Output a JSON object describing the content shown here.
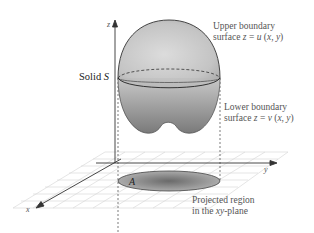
{
  "figure": {
    "labels": {
      "z_axis": "z",
      "y_axis": "y",
      "x_axis": "x",
      "solid": "Solid S",
      "upper_line1": "Upper boundary",
      "upper_line2_prefix": "surface ",
      "upper_line2_eq": "z = u (x, y)",
      "lower_line1": "Lower boundary",
      "lower_line2_prefix": "surface ",
      "lower_line2_eq": "z = v (x, y)",
      "region": "A",
      "projected_line1": "Projected region",
      "projected_line2": "in the xy-plane"
    },
    "colors": {
      "solid_light": "#d2d2d2",
      "solid_dark": "#8a8a8a",
      "grid": "#d0d0d0",
      "axis": "#333333",
      "text": "#555555"
    }
  }
}
